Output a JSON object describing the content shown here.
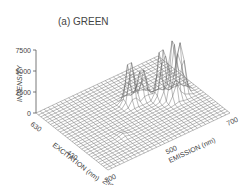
{
  "chart_data": {
    "type": "surface3d",
    "title": "(a) GREEN",
    "zlabel": "INTENSITY",
    "xlabel": "EXCITATION (nm)",
    "ylabel": "EMISSION (nm)",
    "z_ticks": [
      "0",
      "2500",
      "5000",
      "7500"
    ],
    "x_ticks": [
      "630",
      "430",
      "230"
    ],
    "y_ticks": [
      "300",
      "500",
      "700"
    ],
    "zlim": [
      0,
      7500
    ],
    "xlim": [
      630,
      230
    ],
    "ylim": [
      300,
      700
    ],
    "peaks": [
      {
        "excitation": 480,
        "emission": 520,
        "intensity": 6000
      },
      {
        "excitation": 480,
        "emission": 560,
        "intensity": 4000
      },
      {
        "excitation": 440,
        "emission": 600,
        "intensity": 7000
      },
      {
        "excitation": 410,
        "emission": 620,
        "intensity": 7500
      },
      {
        "excitation": 420,
        "emission": 650,
        "intensity": 6500
      },
      {
        "excitation": 350,
        "emission": 420,
        "intensity": 300
      }
    ]
  }
}
